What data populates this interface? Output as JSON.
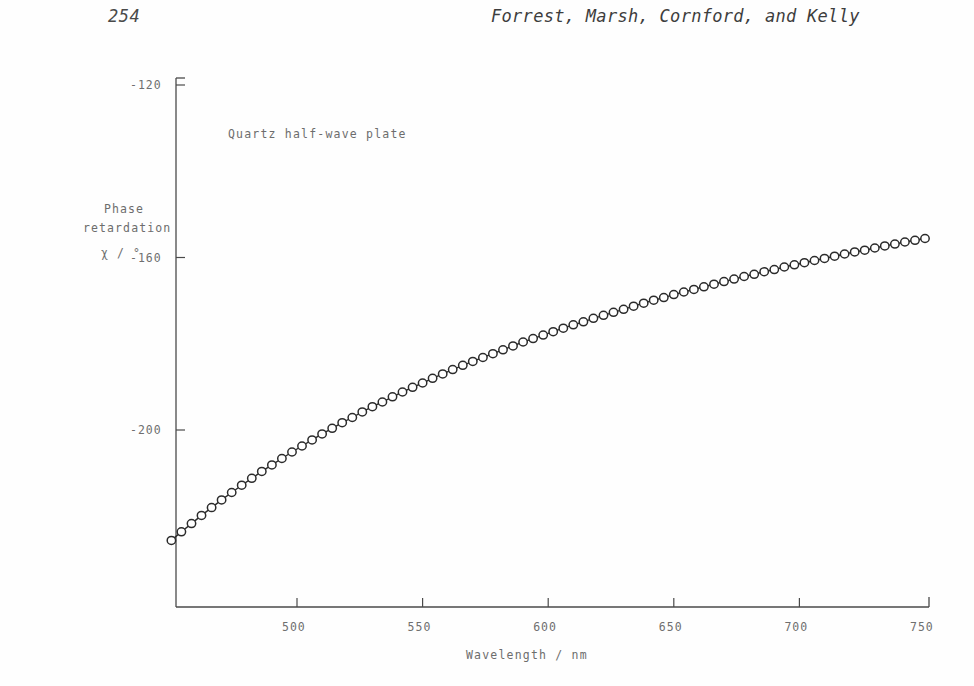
{
  "header": {
    "folio": "254",
    "authors": "Forrest, Marsh, Cornford, and Kelly"
  },
  "chart_data": {
    "type": "line",
    "title": "",
    "annotation": "Quartz half-wave plate",
    "xlabel": "Wavelength / nm",
    "ylabel_lines": [
      "Phase",
      "retardation",
      "χ / °"
    ],
    "xlim": [
      450,
      750
    ],
    "ylim": [
      -228,
      -120
    ],
    "xticks": [
      500,
      550,
      600,
      650,
      700,
      750
    ],
    "xticklabels": [
      "500",
      "550",
      "600",
      "650",
      "700",
      "750"
    ],
    "yticks": [
      -120,
      -160,
      -200
    ],
    "yticklabels": [
      "-120",
      "-160",
      "-200"
    ],
    "grid": false,
    "legend": null,
    "marker": "open-circle",
    "series": [
      {
        "name": "Quartz half-wave plate",
        "x": [
          450,
          454,
          458,
          462,
          466,
          470,
          474,
          478,
          482,
          486,
          490,
          494,
          498,
          502,
          506,
          510,
          514,
          518,
          522,
          526,
          530,
          534,
          538,
          542,
          546,
          550,
          554,
          558,
          562,
          566,
          570,
          574,
          578,
          582,
          586,
          590,
          594,
          598,
          602,
          606,
          610,
          614,
          618,
          622,
          626,
          630,
          634,
          638,
          642,
          646,
          650,
          654,
          658,
          662,
          666,
          670,
          674,
          678,
          682,
          686,
          690,
          694,
          698,
          702,
          706,
          710,
          714,
          718,
          722,
          726,
          730,
          734,
          738,
          742,
          746,
          750
        ],
        "y": [
          -225.6,
          -223.6,
          -221.7,
          -219.8,
          -218.0,
          -216.2,
          -214.5,
          -212.8,
          -211.2,
          -209.6,
          -208.1,
          -206.6,
          -205.1,
          -203.7,
          -202.3,
          -200.9,
          -199.6,
          -198.3,
          -197.1,
          -195.8,
          -194.6,
          -193.5,
          -192.3,
          -191.2,
          -190.1,
          -189.1,
          -188.0,
          -187.0,
          -186.0,
          -185.0,
          -184.1,
          -183.2,
          -182.3,
          -181.4,
          -180.5,
          -179.6,
          -178.8,
          -178.0,
          -177.2,
          -176.4,
          -175.6,
          -174.9,
          -174.1,
          -173.4,
          -172.7,
          -172.0,
          -171.3,
          -170.6,
          -169.9,
          -169.3,
          -168.6,
          -168.0,
          -167.4,
          -166.8,
          -166.2,
          -165.6,
          -165.0,
          -164.4,
          -163.9,
          -163.3,
          -162.8,
          -162.2,
          -161.7,
          -161.2,
          -160.7,
          -160.2,
          -159.7,
          -159.2,
          -158.7,
          -158.3,
          -157.8,
          -157.3,
          -156.9,
          -156.4,
          -156.0,
          -155.6
        ]
      }
    ]
  }
}
